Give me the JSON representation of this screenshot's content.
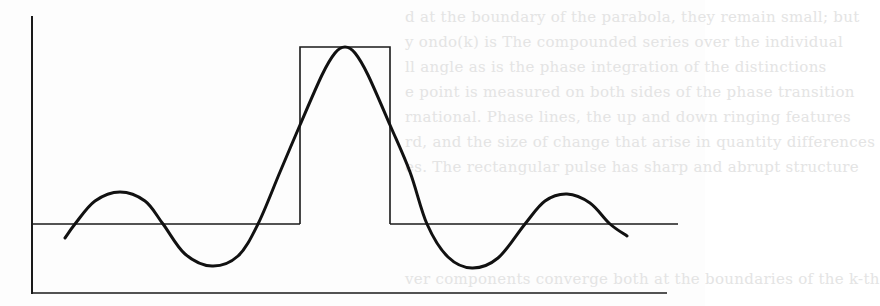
{
  "figure": {
    "colors": {
      "ink": "#1a1a1a",
      "paper": "#fdfdfd",
      "bleed_through": "#e4e4e4"
    },
    "axes": {
      "vertical": {
        "x": 32,
        "y1": 16,
        "y2": 294
      },
      "baseline": {
        "y": 293,
        "x1": 32,
        "x2": 667
      }
    },
    "reference_level": {
      "y": 224,
      "left_x1": 32,
      "left_x2": 300,
      "right_x1": 390,
      "right_x2": 678
    },
    "rect_pulse": {
      "x1": 300,
      "x2": 390,
      "top_y": 47,
      "base_y": 224
    },
    "curve_points": [
      [
        65,
        238
      ],
      [
        75,
        224
      ],
      [
        95,
        201
      ],
      [
        120,
        192
      ],
      [
        145,
        201
      ],
      [
        163,
        224
      ],
      [
        185,
        254
      ],
      [
        212,
        266
      ],
      [
        238,
        256
      ],
      [
        258,
        224
      ],
      [
        280,
        172
      ],
      [
        300,
        125
      ],
      [
        322,
        75
      ],
      [
        335,
        53
      ],
      [
        345,
        47
      ],
      [
        355,
        53
      ],
      [
        368,
        75
      ],
      [
        390,
        125
      ],
      [
        410,
        172
      ],
      [
        427,
        224
      ],
      [
        448,
        257
      ],
      [
        472,
        268
      ],
      [
        498,
        258
      ],
      [
        525,
        224
      ],
      [
        545,
        201
      ],
      [
        567,
        194
      ],
      [
        590,
        203
      ],
      [
        610,
        224
      ],
      [
        627,
        236
      ]
    ]
  },
  "bleed_through_lines": [
    "d at the boundary of the parabola, they remain small; but",
    "y ondo(k) is  The compounded series over the individual",
    "ll angle  as is the phase integration of the distinctions",
    "e point is measured on both sides of the phase transition",
    "rnational. Phase lines, the up and down ringing features",
    "rd, and the size of change that arise in quantity differences",
    "es. The rectangular pulse has sharp and abrupt structure",
    "ver components converge both at the boundaries of the k-th"
  ]
}
